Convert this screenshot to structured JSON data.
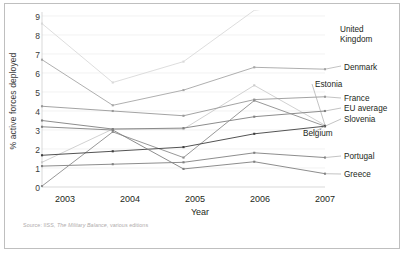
{
  "chart_data": {
    "type": "line",
    "title": "",
    "xlabel": "Year",
    "ylabel": "% active forces deployed",
    "categories": [
      "2003",
      "2004",
      "2005",
      "2006",
      "2007"
    ],
    "x": [
      2003,
      2004,
      2005,
      2006,
      2007
    ],
    "xlim": [
      2003,
      2007
    ],
    "ylim": [
      0,
      9
    ],
    "yticks": [
      "0",
      "1",
      "2",
      "3",
      "4",
      "5",
      "6",
      "7",
      "8",
      "9"
    ],
    "grid": "horizontal",
    "legend_position": "right-inline-labels",
    "source_note": "Source: IISS, The Military Balance, various editions",
    "source_note_prefix": "Source: IISS, ",
    "source_note_italic": "The Military Balance",
    "source_note_suffix": ", various editions",
    "series": [
      {
        "name": "United Kingdom",
        "color": "#d9d9d9",
        "values": [
          8.6,
          5.5,
          6.6,
          9.3,
          9.8
        ]
      },
      {
        "name": "Denmark",
        "color": "#a6a6a6",
        "values": [
          6.7,
          4.3,
          5.1,
          6.3,
          6.2
        ]
      },
      {
        "name": "Estonia",
        "color": "#cccccc",
        "values": [
          1.3,
          3.05,
          3.05,
          5.35,
          3.25
        ]
      },
      {
        "name": "France",
        "color": "#999999",
        "values": [
          4.25,
          4.0,
          3.75,
          4.6,
          4.75
        ]
      },
      {
        "name": "EU average",
        "color": "#7f7f7f",
        "values": [
          3.5,
          3.05,
          3.1,
          3.7,
          4.0
        ]
      },
      {
        "name": "Slovenia",
        "color": "#8c8c8c",
        "values": [
          0.05,
          2.9,
          1.55,
          4.55,
          3.2
        ]
      },
      {
        "name": "Belgium",
        "color": "#3f3f3f",
        "values": [
          1.67,
          1.88,
          2.1,
          2.8,
          3.2
        ]
      },
      {
        "name": "Portugal",
        "color": "#808080",
        "values": [
          1.1,
          1.2,
          1.3,
          1.8,
          1.55
        ]
      },
      {
        "name": "Greece",
        "color": "#808080",
        "values": [
          3.17,
          3.0,
          0.95,
          1.33,
          0.7
        ]
      }
    ],
    "legend_labels": [
      {
        "key": "united-kingdom",
        "line1": "United",
        "line2": "Kingdom"
      },
      {
        "key": "denmark",
        "line1": "Denmark"
      },
      {
        "key": "estonia",
        "line1": "Estonia"
      },
      {
        "key": "france",
        "line1": "France"
      },
      {
        "key": "eu-average",
        "line1": "EU average"
      },
      {
        "key": "slovenia",
        "line1": "Slovenia"
      },
      {
        "key": "belgium",
        "line1": "Belgium"
      },
      {
        "key": "portugal",
        "line1": "Portugal"
      },
      {
        "key": "greece",
        "line1": "Greece"
      }
    ]
  }
}
